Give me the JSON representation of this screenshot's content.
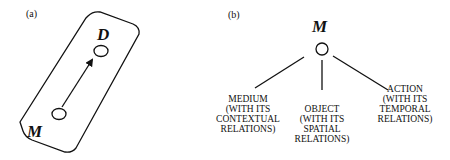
{
  "panel_a": {
    "label": "(a)",
    "top_node": "D",
    "bottom_node": "M"
  },
  "panel_b": {
    "label": "(b)",
    "root": "M",
    "children": [
      {
        "lines": [
          "MEDIUM",
          "(WITH ITS",
          "CONTEXTUAL",
          "RELATIONS)"
        ]
      },
      {
        "lines": [
          "OBJECT",
          "(WITH ITS",
          "SPATIAL",
          "RELATIONS)"
        ]
      },
      {
        "lines": [
          "ACTION",
          "(WITH ITS",
          "TEMPORAL",
          "RELATIONS)"
        ]
      }
    ]
  }
}
